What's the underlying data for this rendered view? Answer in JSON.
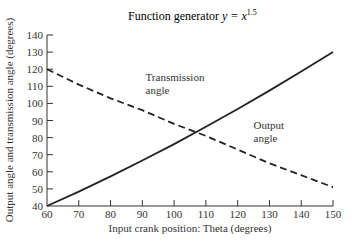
{
  "chart_data": {
    "type": "line",
    "title_main": "Function generator ",
    "title_var": "y = x",
    "title_exp": "1.5",
    "xlabel": "Input crank position: Theta (degrees)",
    "ylabel": "Output angle and transmission angle (degrees)",
    "xlim": [
      60,
      150
    ],
    "ylim": [
      40,
      140
    ],
    "xticks": [
      60,
      70,
      80,
      90,
      100,
      110,
      120,
      130,
      140,
      150
    ],
    "yticks": [
      40,
      50,
      60,
      70,
      80,
      90,
      100,
      110,
      120,
      130,
      140
    ],
    "grid": false,
    "legend": "none (inline annotations)",
    "x": [
      60,
      70,
      80,
      90,
      100,
      110,
      120,
      130,
      140,
      150
    ],
    "series": [
      {
        "name": "Output angle",
        "style": "solid",
        "values": [
          40,
          48.4,
          57.3,
          66.6,
          76.2,
          86.3,
          96.7,
          107.5,
          118.6,
          130
        ]
      },
      {
        "name": "Transmission angle",
        "style": "dashed",
        "values": [
          120,
          111,
          103,
          96,
          88,
          81,
          73,
          65,
          58,
          51
        ]
      }
    ],
    "annotations": [
      {
        "text_lines": [
          "Transmission",
          "angle"
        ],
        "x": 91,
        "y": 113
      },
      {
        "text_lines": [
          "Output",
          "angle"
        ],
        "x": 125,
        "y": 85
      }
    ]
  }
}
